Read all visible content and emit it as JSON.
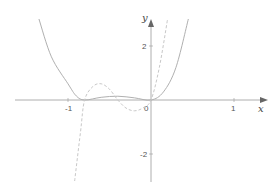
{
  "chart_data": {
    "type": "line",
    "title": "",
    "xlabel": "x",
    "ylabel": "y",
    "xlim": [
      -1.6,
      1.35
    ],
    "ylim": [
      -3,
      3
    ],
    "x_ticks": [
      {
        "value": -1,
        "label": "-1"
      },
      {
        "value": 0,
        "label": "0"
      },
      {
        "value": 1,
        "label": "1"
      }
    ],
    "y_ticks": [
      {
        "value": 2,
        "label": "2"
      },
      {
        "value": -2,
        "label": "-2"
      }
    ],
    "grid": false,
    "legend": null,
    "series": [
      {
        "name": "f(x)",
        "style": "solid",
        "color": "#b0b0b0",
        "description": "Even-degree polynomial with double roots near x=-0.8 and x=0, small hump between, rising steeply outside",
        "points": [
          [
            -1.35,
            3.0
          ],
          [
            -1.2,
            1.6
          ],
          [
            -1.0,
            0.6
          ],
          [
            -0.9,
            0.15
          ],
          [
            -0.8,
            0.0
          ],
          [
            -0.6,
            0.1
          ],
          [
            -0.4,
            0.14
          ],
          [
            -0.2,
            0.08
          ],
          [
            0.0,
            0.0
          ],
          [
            0.15,
            0.3
          ],
          [
            0.3,
            1.2
          ],
          [
            0.45,
            3.0
          ]
        ]
      },
      {
        "name": "f'(x)",
        "style": "dashed",
        "color": "#c8c8c8",
        "description": "Derivative: crosses zero at ~-0.8, -0.4, 0; local max ~0.6 near -0.6, local min ~-0.4 near -0.2",
        "points": [
          [
            -0.92,
            -3.0
          ],
          [
            -0.85,
            -1.2
          ],
          [
            -0.8,
            0.0
          ],
          [
            -0.7,
            0.5
          ],
          [
            -0.6,
            0.6
          ],
          [
            -0.5,
            0.4
          ],
          [
            -0.4,
            0.0
          ],
          [
            -0.3,
            -0.3
          ],
          [
            -0.2,
            -0.4
          ],
          [
            -0.1,
            -0.3
          ],
          [
            0.0,
            0.0
          ],
          [
            0.1,
            1.2
          ],
          [
            0.2,
            3.0
          ]
        ]
      }
    ]
  },
  "colors": {
    "axis": "#999999",
    "text": "#555555"
  }
}
